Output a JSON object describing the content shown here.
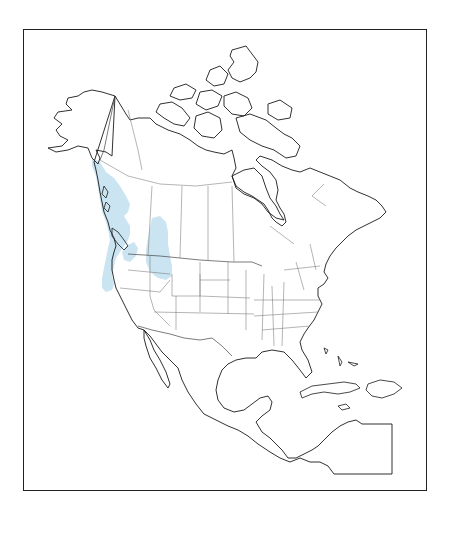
{
  "map": {
    "title": "",
    "region": "North America",
    "projection": "outline base map",
    "frame": {
      "present": true,
      "color": "#222222"
    },
    "range_layer": {
      "name": "species-range",
      "color": "#9fd0e6",
      "areas": [
        "Southeast Alaska coast",
        "British Columbia coast and islands",
        "Washington",
        "Oregon",
        "Northern California coast",
        "Rocky Mountains of SE British Columbia / SW Alberta",
        "Northern Idaho",
        "Western Montana"
      ]
    },
    "inset": {
      "label": "",
      "present": true
    }
  }
}
